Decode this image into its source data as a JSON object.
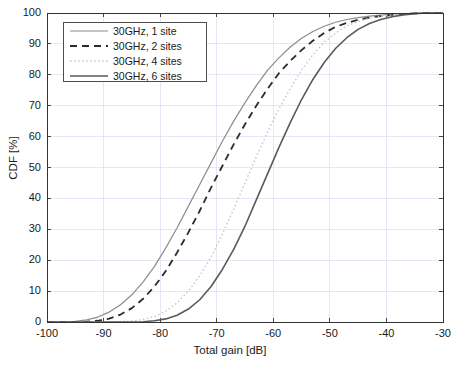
{
  "chart_data": {
    "type": "line",
    "title": "",
    "xlabel": "Total gain [dB]",
    "ylabel": "CDF [%]",
    "xlim": [
      -100,
      -30
    ],
    "ylim": [
      0,
      100
    ],
    "xticks": [
      -100,
      -90,
      -80,
      -70,
      -60,
      -50,
      -40,
      -30
    ],
    "yticks": [
      0,
      10,
      20,
      30,
      40,
      50,
      60,
      70,
      80,
      90,
      100
    ],
    "xtick_labels": [
      "-100",
      "-90",
      "-80",
      "-70",
      "-60",
      "-50",
      "-40",
      "-30"
    ],
    "ytick_labels": [
      "0",
      "10",
      "20",
      "30",
      "40",
      "50",
      "60",
      "70",
      "80",
      "90",
      "100"
    ],
    "grid": true,
    "legend_position": "upper left",
    "series": [
      {
        "name": "30GHz, 1 site",
        "style": "solid",
        "color": "#8c8c8c",
        "width": 1.2,
        "x": [
          -100,
          -97,
          -95,
          -93,
          -91,
          -89,
          -87,
          -85,
          -83,
          -81,
          -79,
          -77,
          -75,
          -73,
          -71,
          -69,
          -67,
          -65,
          -63,
          -61,
          -59,
          -57,
          -55,
          -53,
          -51,
          -49,
          -47,
          -45,
          -43,
          -41,
          -39,
          -37,
          -35,
          -33,
          -30
        ],
        "y": [
          0,
          0,
          0.2,
          0.7,
          1.6,
          3.2,
          5.6,
          8.8,
          13.0,
          18.0,
          24.0,
          30.5,
          37.5,
          44.5,
          51.5,
          58.5,
          65.0,
          71.0,
          76.5,
          81.5,
          85.5,
          89.0,
          91.8,
          94.0,
          95.7,
          97.0,
          97.9,
          98.5,
          99.0,
          99.3,
          99.6,
          99.8,
          99.9,
          100,
          100
        ]
      },
      {
        "name": "30GHz, 2 sites",
        "style": "dashed",
        "color": "#2b2b2b",
        "width": 1.8,
        "x": [
          -100,
          -97,
          -95,
          -93,
          -91,
          -89,
          -87,
          -85,
          -83,
          -81,
          -79,
          -77,
          -75,
          -73,
          -71,
          -69,
          -67,
          -65,
          -63,
          -61,
          -59,
          -57,
          -55,
          -53,
          -51,
          -49,
          -47,
          -45,
          -43,
          -41,
          -39,
          -37,
          -35,
          -33,
          -30
        ],
        "y": [
          0,
          0,
          0,
          0.1,
          0.4,
          1.1,
          2.4,
          4.5,
          7.5,
          11.5,
          16.5,
          22.5,
          29.0,
          36.0,
          43.5,
          50.5,
          57.5,
          64.0,
          70.0,
          75.5,
          80.5,
          84.5,
          88.0,
          91.0,
          93.5,
          95.5,
          96.8,
          97.8,
          98.5,
          99.0,
          99.4,
          99.7,
          99.9,
          100,
          100
        ]
      },
      {
        "name": "30GHz, 4 sites",
        "style": "dotted-light",
        "color": "#c8c8c8",
        "width": 1.4,
        "x": [
          -100,
          -97,
          -95,
          -93,
          -91,
          -89,
          -87,
          -85,
          -83,
          -81,
          -79,
          -77,
          -75,
          -73,
          -71,
          -69,
          -67,
          -65,
          -63,
          -61,
          -59,
          -57,
          -55,
          -53,
          -51,
          -49,
          -47,
          -45,
          -43,
          -41,
          -39,
          -37,
          -35,
          -33,
          -30
        ],
        "y": [
          0,
          0,
          0,
          0,
          0,
          0,
          0.1,
          0.3,
          0.8,
          1.8,
          3.5,
          6.2,
          10.0,
          15.0,
          21.0,
          28.5,
          36.5,
          45.0,
          53.5,
          61.5,
          69.0,
          75.5,
          81.5,
          86.5,
          90.5,
          93.5,
          95.8,
          97.3,
          98.3,
          99.0,
          99.4,
          99.7,
          99.9,
          100,
          100
        ]
      },
      {
        "name": "30GHz, 6 sites",
        "style": "solid",
        "color": "#5a5a5a",
        "width": 1.6,
        "x": [
          -100,
          -97,
          -95,
          -93,
          -91,
          -89,
          -87,
          -85,
          -83,
          -81,
          -79,
          -77,
          -75,
          -73,
          -71,
          -69,
          -67,
          -65,
          -63,
          -61,
          -59,
          -57,
          -55,
          -53,
          -51,
          -49,
          -47,
          -45,
          -43,
          -41,
          -39,
          -37,
          -35,
          -33,
          -30
        ],
        "y": [
          0,
          0,
          0,
          0,
          0,
          0,
          0,
          0,
          0.1,
          0.4,
          1.0,
          2.2,
          4.2,
          7.2,
          11.5,
          17.0,
          23.5,
          31.0,
          39.5,
          48.0,
          56.5,
          64.5,
          72.0,
          78.5,
          84.0,
          88.5,
          92.0,
          94.7,
          96.6,
          97.9,
          98.8,
          99.4,
          99.8,
          100,
          100
        ]
      }
    ]
  },
  "legend": {
    "items": [
      {
        "label": "30GHz, 1 site"
      },
      {
        "label": "30GHz, 2 sites"
      },
      {
        "label": "30GHz, 4 sites"
      },
      {
        "label": "30GHz, 6 sites"
      }
    ]
  }
}
